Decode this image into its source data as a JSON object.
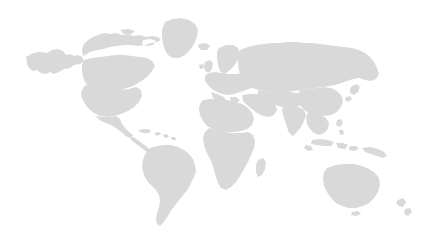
{
  "map": {
    "type": "world-silhouette",
    "projection": "equirectangular",
    "width": 431,
    "height": 244,
    "background_color": "#ffffff",
    "land_color": "#d9d9d9",
    "has_labels": false,
    "has_borders": false,
    "has_graticule": false,
    "has_legend": false,
    "has_antarctica": false,
    "regions": [
      {
        "name": "alaska"
      },
      {
        "name": "canada"
      },
      {
        "name": "greenland"
      },
      {
        "name": "united-states"
      },
      {
        "name": "mexico"
      },
      {
        "name": "central-america"
      },
      {
        "name": "caribbean-islands"
      },
      {
        "name": "south-america"
      },
      {
        "name": "iceland"
      },
      {
        "name": "british-isles"
      },
      {
        "name": "scandinavia"
      },
      {
        "name": "europe"
      },
      {
        "name": "north-africa"
      },
      {
        "name": "sub-saharan-africa"
      },
      {
        "name": "madagascar"
      },
      {
        "name": "middle-east"
      },
      {
        "name": "russia-siberia"
      },
      {
        "name": "central-asia"
      },
      {
        "name": "india"
      },
      {
        "name": "china"
      },
      {
        "name": "japan"
      },
      {
        "name": "southeast-asia"
      },
      {
        "name": "philippines"
      },
      {
        "name": "indonesia"
      },
      {
        "name": "new-guinea"
      },
      {
        "name": "australia"
      },
      {
        "name": "new-zealand"
      }
    ]
  }
}
